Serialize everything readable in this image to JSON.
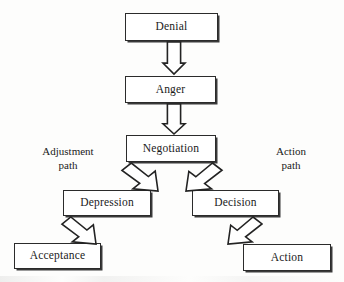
{
  "diagram": {
    "background_color": "#fdfdfc",
    "box_fill": "#ffffff",
    "line_color": "#232323",
    "nodes": [
      {
        "id": "denial",
        "label": "Denial",
        "x": 125,
        "y": 13,
        "w": 93,
        "h": 28
      },
      {
        "id": "anger",
        "label": "Anger",
        "x": 125,
        "y": 76,
        "w": 91,
        "h": 27
      },
      {
        "id": "negotiation",
        "label": "Negotiation",
        "x": 126,
        "y": 135,
        "w": 90,
        "h": 27
      },
      {
        "id": "depression",
        "label": "Depression",
        "x": 63,
        "y": 190,
        "w": 88,
        "h": 26
      },
      {
        "id": "decision",
        "label": "Decision",
        "x": 192,
        "y": 190,
        "w": 87,
        "h": 26
      },
      {
        "id": "acceptance",
        "label": "Acceptance",
        "x": 14,
        "y": 243,
        "w": 87,
        "h": 26
      },
      {
        "id": "action",
        "label": "Action",
        "x": 243,
        "y": 244,
        "w": 88,
        "h": 27
      }
    ],
    "path_labels": [
      {
        "id": "adjustment-path",
        "text": "Adjustment\npath",
        "x": 22,
        "y": 145,
        "w": 92
      },
      {
        "id": "action-path",
        "text": "Action\npath",
        "x": 250,
        "y": 145,
        "w": 82
      }
    ],
    "arrows": [
      {
        "id": "denial-to-anger",
        "from": "denial",
        "to": "anger",
        "direction": "down",
        "x": 163,
        "y": 42,
        "w": 22,
        "h": 32
      },
      {
        "id": "anger-to-negotiation",
        "from": "anger",
        "to": "negotiation",
        "direction": "down",
        "x": 163,
        "y": 104,
        "w": 22,
        "h": 30
      },
      {
        "id": "negotiation-to-depression",
        "from": "negotiation",
        "to": "depression",
        "direction": "down-left",
        "x": 122,
        "y": 163,
        "w": 36,
        "h": 28
      },
      {
        "id": "negotiation-to-decision",
        "from": "negotiation",
        "to": "decision",
        "direction": "down-right",
        "x": 186,
        "y": 163,
        "w": 36,
        "h": 28
      },
      {
        "id": "depression-to-acceptance",
        "from": "depression",
        "to": "acceptance",
        "direction": "down-left",
        "x": 62,
        "y": 217,
        "w": 34,
        "h": 27
      },
      {
        "id": "decision-to-action",
        "from": "decision",
        "to": "action",
        "direction": "down-right",
        "x": 228,
        "y": 217,
        "w": 34,
        "h": 27
      }
    ]
  }
}
